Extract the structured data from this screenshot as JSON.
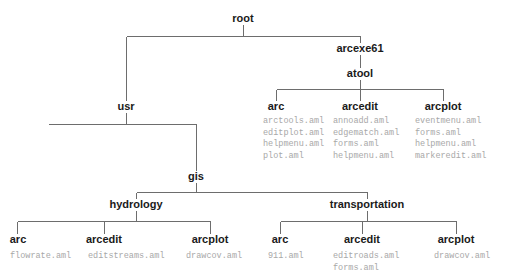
{
  "diagram": {
    "line_color": "#6d6d6d",
    "node_text_color": "#1a1a1a",
    "file_text_color": "#a8a8a8",
    "background_color": "#ffffff"
  },
  "nodes": {
    "root": {
      "label": "root",
      "x": 243,
      "y": 18
    },
    "arcexe61": {
      "label": "arcexe61",
      "x": 360,
      "y": 48
    },
    "atool": {
      "label": "atool",
      "x": 360,
      "y": 73
    },
    "atool_arc": {
      "label": "arc",
      "x": 276,
      "y": 106
    },
    "atool_arcedit": {
      "label": "arcedit",
      "x": 360,
      "y": 106
    },
    "atool_arcplot": {
      "label": "arcplot",
      "x": 443,
      "y": 106
    },
    "usr": {
      "label": "usr",
      "x": 122,
      "y": 106
    },
    "gis": {
      "label": "gis",
      "x": 196,
      "y": 176
    },
    "hydrology": {
      "label": "hydrology",
      "x": 136,
      "y": 204
    },
    "transportation": {
      "label": "transportation",
      "x": 367,
      "y": 204
    },
    "hyd_arc": {
      "label": "arc",
      "x": 18,
      "y": 240
    },
    "hyd_arcedit": {
      "label": "arcedit",
      "x": 104,
      "y": 240
    },
    "hyd_arcplot": {
      "label": "arcplot",
      "x": 210,
      "y": 240
    },
    "trn_arc": {
      "label": "arc",
      "x": 280,
      "y": 240
    },
    "trn_arcedit": {
      "label": "arcedit",
      "x": 362,
      "y": 240
    },
    "trn_arcplot": {
      "label": "arcplot",
      "x": 456,
      "y": 240
    }
  },
  "file_lists": {
    "atool_arc": {
      "x": 263,
      "y": 116,
      "files": [
        "arctools.aml",
        "editplot.aml",
        "helpmenu.aml",
        "plot.aml"
      ]
    },
    "atool_arcedit": {
      "x": 333,
      "y": 116,
      "files": [
        "annoadd.aml",
        "edgematch.aml",
        "forms.aml",
        "helpmenu.aml"
      ]
    },
    "atool_arcplot": {
      "x": 415,
      "y": 116,
      "files": [
        "eventmenu.aml",
        "forms.aml",
        "helpmenu.aml",
        "markeredit.aml"
      ]
    },
    "hyd_arc": {
      "x": 10,
      "y": 251,
      "files": [
        "flowrate.aml"
      ]
    },
    "hyd_arcedit": {
      "x": 88,
      "y": 251,
      "files": [
        "editstreams.aml"
      ]
    },
    "hyd_arcplot": {
      "x": 186,
      "y": 251,
      "files": [
        "drawcov.aml"
      ]
    },
    "trn_arc": {
      "x": 268,
      "y": 251,
      "files": [
        "911.aml"
      ]
    },
    "trn_arcedit": {
      "x": 333,
      "y": 251,
      "files": [
        "editroads.aml",
        "forms.aml"
      ]
    },
    "trn_arcplot": {
      "x": 434,
      "y": 251,
      "files": [
        "drawcov.aml"
      ]
    }
  },
  "tree_structure": {
    "root": {
      "children": [
        "usr",
        "arcexe61"
      ]
    },
    "arcexe61": {
      "children": [
        "atool"
      ]
    },
    "atool": {
      "children": [
        "arc",
        "arcedit",
        "arcplot"
      ]
    },
    "usr": {
      "children": [
        "gis"
      ]
    },
    "gis": {
      "children": [
        "hydrology",
        "transportation"
      ]
    },
    "hydrology": {
      "children": [
        "arc",
        "arcedit",
        "arcplot"
      ]
    },
    "transportation": {
      "children": [
        "arc",
        "arcedit",
        "arcplot"
      ]
    }
  }
}
